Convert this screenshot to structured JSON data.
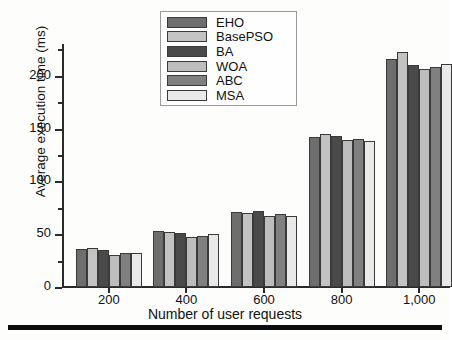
{
  "chart_data": {
    "type": "bar",
    "title": "",
    "xlabel": "Number of  user requests",
    "ylabel": "Average execution time (ms)",
    "categories": [
      "200",
      "400",
      "600",
      "800",
      "1,000"
    ],
    "ylim": [
      0,
      230
    ],
    "yticks": [
      0,
      50,
      100,
      150,
      200
    ],
    "ytick_labels": [
      "0",
      "50",
      "100",
      "150",
      "200"
    ],
    "yminor_ticks": [
      25,
      75,
      125,
      175,
      225
    ],
    "grid": false,
    "legend_position": "top-center",
    "series": [
      {
        "name": "EHO",
        "color": "#6e6e6e",
        "values": [
          36,
          53,
          71,
          142,
          216
        ]
      },
      {
        "name": "BasePSO",
        "color": "#c3c3c3",
        "values": [
          37,
          52,
          70,
          145,
          222
        ]
      },
      {
        "name": "BA",
        "color": "#4a4a4a",
        "values": [
          35,
          51,
          72,
          143,
          210
        ]
      },
      {
        "name": "WOA",
        "color": "#bdbdbd",
        "values": [
          30,
          47,
          67,
          139,
          206
        ]
      },
      {
        "name": "ABC",
        "color": "#808080",
        "values": [
          32,
          48,
          69,
          140,
          208
        ]
      },
      {
        "name": "MSA",
        "color": "#e9e9e9",
        "values": [
          32,
          50,
          67,
          138,
          211
        ]
      }
    ]
  },
  "axes": {
    "y_title": "Average execution time (ms)",
    "x_title_part1": "Number of",
    "x_title_part2": "user requests"
  },
  "legend": {
    "items": [
      {
        "label": "EHO"
      },
      {
        "label": "BasePSO"
      },
      {
        "label": "BA"
      },
      {
        "label": "WOA"
      },
      {
        "label": "ABC"
      },
      {
        "label": "MSA"
      }
    ]
  }
}
